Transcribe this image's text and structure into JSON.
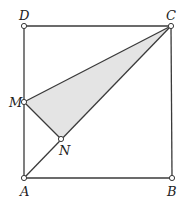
{
  "diagram": {
    "colors": {
      "line": "#3a3a3a",
      "shade": "#e4e4e4",
      "point_fill": "#ffffff",
      "label": "#222222"
    },
    "points": {
      "A": {
        "label": "A",
        "x": 24,
        "y": 178
      },
      "B": {
        "label": "B",
        "x": 172,
        "y": 178
      },
      "C": {
        "label": "C",
        "x": 171,
        "y": 26
      },
      "D": {
        "label": "D",
        "x": 24,
        "y": 26
      },
      "M": {
        "label": "M",
        "x": 24,
        "y": 102
      },
      "N": {
        "label": "N",
        "x": 61,
        "y": 139
      }
    },
    "shaded_region": "triangle CMN",
    "segments": [
      "AB",
      "BC",
      "CD",
      "DA",
      "AC",
      "MN",
      "MC"
    ]
  }
}
